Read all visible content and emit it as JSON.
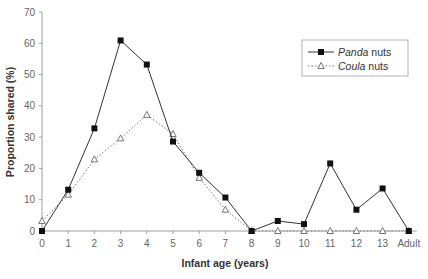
{
  "chart_data": {
    "type": "line",
    "title": "",
    "xlabel": "Infant age (years)",
    "ylabel": "Proportion shared (%)",
    "ylim": [
      0,
      70
    ],
    "yticks": [
      0,
      10,
      20,
      30,
      40,
      50,
      60,
      70
    ],
    "categories": [
      "0",
      "1",
      "2",
      "3",
      "4",
      "5",
      "6",
      "7",
      "8",
      "9",
      "10",
      "11",
      "12",
      "13",
      "Adult"
    ],
    "grid": false,
    "legend_position": "upper right",
    "series": [
      {
        "name": "Panda nuts",
        "name_italic": "Panda",
        "name_suffix": " nuts",
        "marker": "filled-square",
        "line_style": "solid",
        "values": [
          0,
          13.2,
          32.8,
          60.9,
          53.2,
          28.6,
          18.6,
          10.7,
          0,
          3.2,
          2.2,
          21.6,
          6.8,
          13.6,
          0
        ]
      },
      {
        "name": "Coula nuts",
        "name_italic": "Coula",
        "name_suffix": " nuts",
        "marker": "hollow-triangle",
        "line_style": "dotted",
        "values": [
          3.2,
          11.6,
          22.9,
          29.6,
          37.1,
          31.0,
          17.0,
          6.8,
          0,
          0,
          0,
          0,
          0,
          0,
          0
        ]
      }
    ]
  },
  "colors": {
    "axis": "#a0a0a0",
    "series_line": "#333333",
    "marker_fill": "#111111",
    "tick_text": "#666666",
    "title_text": "#333333"
  }
}
